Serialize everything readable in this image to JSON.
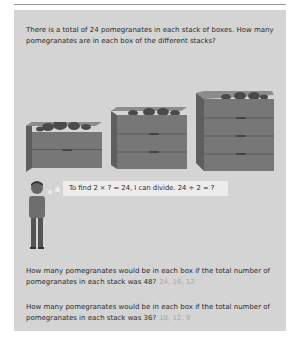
{
  "intro": "There is a total of 24 pomegranates in each stack of boxes. How many pomegranates are in each box of the different stacks?",
  "stacks": [
    {
      "boxes": 2,
      "lhs": "2 ×",
      "answer": "12",
      "rhs": "= 24"
    },
    {
      "boxes": 3,
      "lhs": "3 ×",
      "answer": "8",
      "rhs": "= 24"
    },
    {
      "boxes": 4,
      "lhs": "4 ×",
      "answer": "6",
      "rhs": "= 24"
    }
  ],
  "speech_bubble": "To find 2 × ? = 24, I can divide. 24 ÷ 2 = ?",
  "questions": [
    {
      "text": "How many pomegranates would be in each box if the total number of pomegranates in each stack was 48?",
      "answer": "24, 16, 12"
    },
    {
      "text": "How many pomegranates would be in each box if the total number of pomegranates in each stack was 36?",
      "answer": "18, 12, 9"
    }
  ],
  "colors": {
    "panel": "#d4d4d4",
    "box_front": "#777777",
    "box_side": "#5e5e5e",
    "box_top": "#8c8c8c",
    "fruit": "#4a4a4a",
    "answer_text": "#a8a8a8"
  }
}
